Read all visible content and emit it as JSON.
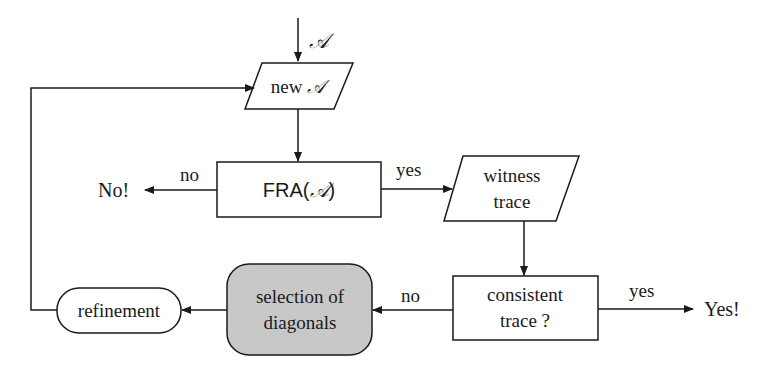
{
  "diagram": {
    "input_label": "𝒜",
    "nodes": {
      "new_a": {
        "label_prefix": "new ",
        "label_symbol": "𝒜",
        "shape": "parallelogram"
      },
      "fra": {
        "label_prefix": "FRA(",
        "label_symbol": "𝒜",
        "label_suffix": ")",
        "shape": "rectangle"
      },
      "witness": {
        "line1": "witness",
        "line2": "trace",
        "shape": "parallelogram"
      },
      "consistent": {
        "line1": "consistent",
        "line2": "trace ?",
        "shape": "rectangle"
      },
      "selection": {
        "line1": "selection of",
        "line2": "diagonals",
        "shape": "rounded-rectangle",
        "fill": "#c8c8c8"
      },
      "refinement": {
        "label": "refinement",
        "shape": "stadium"
      }
    },
    "edges": {
      "fra_no": "no",
      "fra_yes": "yes",
      "consistent_no": "no",
      "consistent_yes": "yes"
    },
    "outcomes": {
      "no": "No!",
      "yes": "Yes!"
    },
    "colors": {
      "stroke": "#1a1a1a",
      "highlight_fill": "#c8c8c8",
      "background": "#ffffff"
    }
  }
}
